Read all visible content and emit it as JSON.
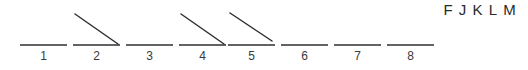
{
  "figure": {
    "width": 528,
    "height": 70,
    "background_color": "#ffffff",
    "stroke_color": "#2f2f2f",
    "label_color": "#3a3a3a",
    "baseline_width": 47,
    "baseline_y": 45,
    "item_spacing": 53,
    "first_item_x": 20
  },
  "letters": {
    "sequence": [
      "F",
      "J",
      "K",
      "L",
      "M"
    ]
  },
  "items": [
    {
      "number": "1",
      "x": 20,
      "has_diagonal": false,
      "diagonal": null
    },
    {
      "number": "2",
      "x": 73,
      "has_diagonal": true,
      "diagonal": {
        "x1": 2,
        "y1": 14,
        "x2": 45,
        "y2": 44
      }
    },
    {
      "number": "3",
      "x": 126,
      "has_diagonal": false,
      "diagonal": null
    },
    {
      "number": "4",
      "x": 179,
      "has_diagonal": true,
      "diagonal": {
        "x1": 2,
        "y1": 14,
        "x2": 45,
        "y2": 44
      }
    },
    {
      "number": "5",
      "x": 228,
      "has_diagonal": true,
      "diagonal": {
        "x1": 2,
        "y1": 13,
        "x2": 44,
        "y2": 41
      }
    },
    {
      "number": "6",
      "x": 281,
      "has_diagonal": false,
      "diagonal": null
    },
    {
      "number": "7",
      "x": 334,
      "has_diagonal": false,
      "diagonal": null
    },
    {
      "number": "8",
      "x": 387,
      "has_diagonal": false,
      "diagonal": null
    }
  ]
}
